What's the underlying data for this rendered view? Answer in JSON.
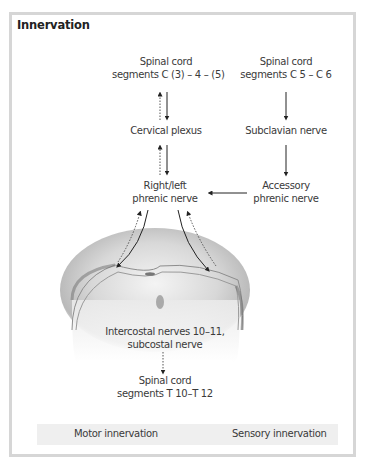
{
  "figure": {
    "title": "Innervation",
    "nodes": {
      "spinal_c345": {
        "line1": "Spinal cord",
        "line2": "segments C (3) – 4 – (5)"
      },
      "spinal_c56": {
        "line1": "Spinal cord",
        "line2": "segments C 5 – C 6"
      },
      "cervical_plexus": {
        "line1": "Cervical plexus"
      },
      "subclavian_nerve": {
        "line1": "Subclavian nerve"
      },
      "phrenic_nerve": {
        "line1": "Right/left",
        "line2": "phrenic nerve"
      },
      "accessory_phrenic": {
        "line1": "Accessory",
        "line2": "phrenic nerve"
      },
      "intercostal": {
        "line1": "Intercostal nerves 10–11,",
        "line2": "subcostal nerve"
      },
      "spinal_t1012": {
        "line1": "Spinal cord",
        "line2": "segments T 10–T 12"
      }
    },
    "illustration": "diaphragm-drawing",
    "legend": {
      "motor": "Motor innervation",
      "sensory": "Sensory innervation"
    },
    "colors": {
      "frame_border": "#d6d6d6",
      "legend_bg": "#efefef",
      "text": "#3a3a3a",
      "arrow": "#222222"
    }
  }
}
